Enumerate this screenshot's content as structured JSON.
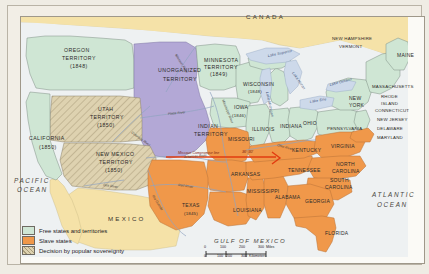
{
  "colors": {
    "free": "#cfe6d4",
    "slave": "#f0984a",
    "popular_sovereignty": "#ded2b0",
    "unorganized": "#b3a8d6",
    "canada_mexico": "#f5e2a8",
    "water": "#cdd9ea",
    "compromise_line": "#e23c10",
    "border": "#6e6a62"
  },
  "map": {
    "countries": [
      {
        "name": "CANADA",
        "x": 246,
        "y": 19
      },
      {
        "name": "MEXICO",
        "x": 108,
        "y": 221
      }
    ],
    "oceans": [
      {
        "name": "PACIFIC",
        "x": 14,
        "y": 183
      },
      {
        "name": "OCEAN",
        "x": 17,
        "y": 192
      },
      {
        "name": "ATLANTIC",
        "x": 372,
        "y": 197
      },
      {
        "name": "OCEAN",
        "x": 377,
        "y": 207
      }
    ],
    "gulf": {
      "name": "GULF OF MEXICO",
      "x": 214,
      "y": 243
    },
    "territories": [
      {
        "name": "OREGON",
        "x": 64,
        "y": 52
      },
      {
        "name": "TERRITORY",
        "x": 62,
        "y": 60
      },
      {
        "name": "(1848)",
        "x": 70,
        "y": 68
      },
      {
        "name": "UNORGANIZED",
        "x": 158,
        "y": 72
      },
      {
        "name": "TERRITORY",
        "x": 163,
        "y": 81
      },
      {
        "name": "MINNESOTA",
        "x": 204,
        "y": 62
      },
      {
        "name": "TERRITORY",
        "x": 204,
        "y": 69
      },
      {
        "name": "(1849)",
        "x": 210,
        "y": 76
      },
      {
        "name": "UTAH",
        "x": 98,
        "y": 111
      },
      {
        "name": "TERRITORY",
        "x": 90,
        "y": 119
      },
      {
        "name": "(1850)",
        "x": 97,
        "y": 127
      },
      {
        "name": "NEW MEXICO",
        "x": 96,
        "y": 156
      },
      {
        "name": "TERRITORY",
        "x": 99,
        "y": 164
      },
      {
        "name": "(1850)",
        "x": 105,
        "y": 172
      },
      {
        "name": "INDIAN",
        "x": 198,
        "y": 128
      },
      {
        "name": "TERRITORY",
        "x": 194,
        "y": 136
      },
      {
        "name": "CALIFORNIA",
        "x": 29,
        "y": 140
      },
      {
        "name": "(1850)",
        "x": 39,
        "y": 149
      }
    ],
    "states": [
      {
        "name": "WISCONSIN",
        "x": 243,
        "y": 86,
        "cls": "state"
      },
      {
        "name": "(1848)",
        "x": 248,
        "y": 93,
        "cls": "statesm"
      },
      {
        "name": "IOWA",
        "x": 234,
        "y": 109,
        "cls": "state"
      },
      {
        "name": "(1846)",
        "x": 232,
        "y": 117,
        "cls": "statesm"
      },
      {
        "name": "ILLINOIS",
        "x": 252,
        "y": 131,
        "cls": "state"
      },
      {
        "name": "INDIANA",
        "x": 280,
        "y": 128,
        "cls": "state"
      },
      {
        "name": "OHIO",
        "x": 303,
        "y": 125,
        "cls": "state"
      },
      {
        "name": "MISSOURI",
        "x": 228,
        "y": 141,
        "cls": "state"
      },
      {
        "name": "KENTUCKY",
        "x": 292,
        "y": 152,
        "cls": "state"
      },
      {
        "name": "TENNESSEE",
        "x": 288,
        "y": 172,
        "cls": "state"
      },
      {
        "name": "ARKANSAS",
        "x": 231,
        "y": 176,
        "cls": "state"
      },
      {
        "name": "MISSISSIPPI",
        "x": 247,
        "y": 193,
        "cls": "state"
      },
      {
        "name": "ALABAMA",
        "x": 275,
        "y": 199,
        "cls": "state"
      },
      {
        "name": "GEORGIA",
        "x": 305,
        "y": 203,
        "cls": "state"
      },
      {
        "name": "FLORIDA",
        "x": 325,
        "y": 235,
        "cls": "state"
      },
      {
        "name": "LOUISIANA",
        "x": 233,
        "y": 212,
        "cls": "state"
      },
      {
        "name": "TEXAS",
        "x": 182,
        "y": 207,
        "cls": "state"
      },
      {
        "name": "(1845)",
        "x": 184,
        "y": 215,
        "cls": "statesm"
      },
      {
        "name": "VIRGINIA",
        "x": 331,
        "y": 148,
        "cls": "state"
      },
      {
        "name": "NORTH",
        "x": 336,
        "y": 166,
        "cls": "state"
      },
      {
        "name": "CAROLINA",
        "x": 332,
        "y": 173,
        "cls": "state"
      },
      {
        "name": "SOUTH",
        "x": 330,
        "y": 182,
        "cls": "state"
      },
      {
        "name": "CAROLINA",
        "x": 325,
        "y": 189,
        "cls": "state"
      },
      {
        "name": "PENNSYLVANIA",
        "x": 327,
        "y": 130,
        "cls": "statesm"
      },
      {
        "name": "NEW",
        "x": 349,
        "y": 100,
        "cls": "state"
      },
      {
        "name": "YORK",
        "x": 349,
        "y": 107,
        "cls": "state"
      },
      {
        "name": "NEW HAMPSHIRE",
        "x": 332,
        "y": 40,
        "cls": "statesm"
      },
      {
        "name": "VERMONT",
        "x": 339,
        "y": 48,
        "cls": "statesm"
      },
      {
        "name": "MAINE",
        "x": 397,
        "y": 57,
        "cls": "state"
      },
      {
        "name": "MASSACHUSETTS",
        "x": 372,
        "y": 88,
        "cls": "statesm"
      },
      {
        "name": "RHODE",
        "x": 381,
        "y": 98,
        "cls": "statesm"
      },
      {
        "name": "ISLAND",
        "x": 381,
        "y": 105,
        "cls": "statesm"
      },
      {
        "name": "CONNECTICUT",
        "x": 375,
        "y": 112,
        "cls": "statesm"
      },
      {
        "name": "NEW JERSEY",
        "x": 377,
        "y": 121,
        "cls": "statesm"
      },
      {
        "name": "DELAWARE",
        "x": 377,
        "y": 130,
        "cls": "statesm"
      },
      {
        "name": "MARYLAND",
        "x": 377,
        "y": 139,
        "cls": "statesm"
      }
    ],
    "water_labels": [
      {
        "name": "Lake Superior",
        "x": 268,
        "y": 57,
        "rot": -12
      },
      {
        "name": "Lake Michigan",
        "x": 266,
        "y": 92,
        "rot": 78
      },
      {
        "name": "Lake Huron",
        "x": 292,
        "y": 73,
        "rot": 55
      },
      {
        "name": "Lake Erie",
        "x": 310,
        "y": 103,
        "rot": -10
      },
      {
        "name": "Lake Ontario",
        "x": 330,
        "y": 86,
        "rot": -15
      }
    ],
    "rivers": [
      {
        "name": "Missouri River",
        "x": 175,
        "y": 55,
        "rot": 58
      },
      {
        "name": "Mississippi River",
        "x": 222,
        "y": 100,
        "rot": 68
      },
      {
        "name": "Platte River",
        "x": 168,
        "y": 115,
        "rot": -6
      },
      {
        "name": "Colorado River",
        "x": 131,
        "y": 133,
        "rot": 36
      },
      {
        "name": "Gila River",
        "x": 103,
        "y": 186,
        "rot": 8
      },
      {
        "name": "Red River",
        "x": 178,
        "y": 186,
        "rot": 8
      },
      {
        "name": "Ohio River",
        "x": 277,
        "y": 146,
        "rot": 16
      },
      {
        "name": "Rio Grande",
        "x": 152,
        "y": 196,
        "rot": 58
      },
      {
        "name": "Arkansas River",
        "x": 184,
        "y": 158,
        "rot": -4
      }
    ],
    "compromise": {
      "label": "Missouri Compromise line",
      "latitude_label": "36° 30'",
      "label_x": 178,
      "label_y": 154,
      "lat_x": 242,
      "lat_y": 153,
      "y_line": 157,
      "x_start": 166,
      "x_end": 276
    }
  },
  "legend": {
    "items": [
      {
        "label": "Free states and territories",
        "color": "#cfe6d4",
        "pattern": "solid"
      },
      {
        "label": "Slave states",
        "color": "#f0984a",
        "pattern": "solid"
      },
      {
        "label": "Decision by popular sovereignty",
        "color": "#ded2b0",
        "pattern": "hatch"
      }
    ]
  },
  "scale": {
    "miles_label": "Miles",
    "km_label": "Kilometers",
    "miles_ticks": [
      "0",
      "100",
      "200",
      "300"
    ],
    "km_ticks": [
      "0",
      "100",
      "200",
      "300"
    ]
  }
}
